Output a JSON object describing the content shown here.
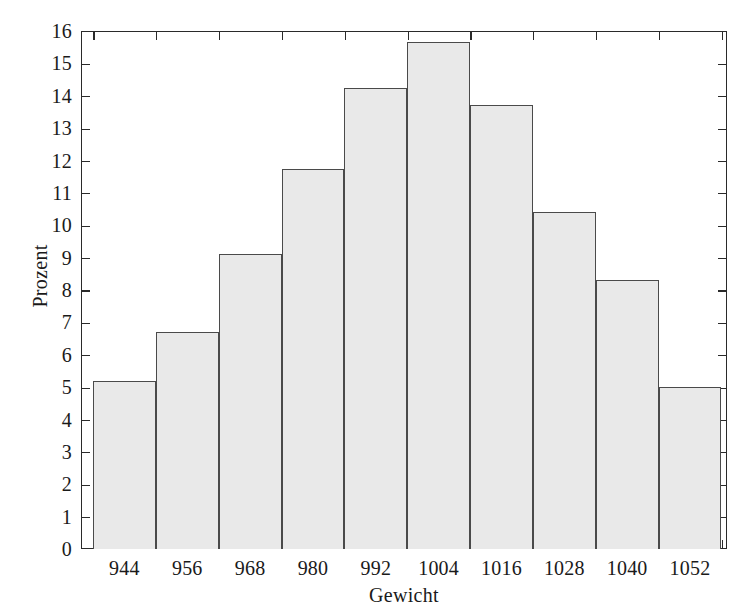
{
  "chart_data": {
    "type": "bar",
    "title": "",
    "subtitle": "",
    "xlabel": "Gewicht",
    "ylabel": "Prozent",
    "categories": [
      "944",
      "956",
      "968",
      "980",
      "992",
      "1004",
      "1016",
      "1028",
      "1040",
      "1052"
    ],
    "values": [
      5.2,
      6.7,
      9.1,
      11.75,
      14.25,
      15.65,
      13.7,
      10.4,
      8.3,
      5.0
    ],
    "bin_width": 12,
    "ylim": [
      0,
      16
    ],
    "yticks": [
      0,
      1,
      2,
      3,
      4,
      5,
      6,
      7,
      8,
      9,
      10,
      11,
      12,
      13,
      14,
      15,
      16
    ],
    "ytick_labels": [
      "0",
      "1",
      "2",
      "3",
      "4",
      "5",
      "6",
      "7",
      "8",
      "9",
      "10",
      "11",
      "12",
      "13",
      "14",
      "15",
      "16"
    ],
    "xtick_labels": [
      "944",
      "956",
      "968",
      "980",
      "992",
      "1004",
      "1016",
      "1028",
      "1040",
      "1052"
    ],
    "grid": false,
    "legend": null,
    "legend_position": "none",
    "annotations": [],
    "bar_fill_color": "#e9e9e9",
    "bar_edge_color": "#4a4a4a",
    "axis_color": "#2a2a2a",
    "background_color": "#ffffff",
    "ticks_inward": true,
    "ticks_all_sides": true
  },
  "figure": {
    "width": 737,
    "height": 612
  }
}
